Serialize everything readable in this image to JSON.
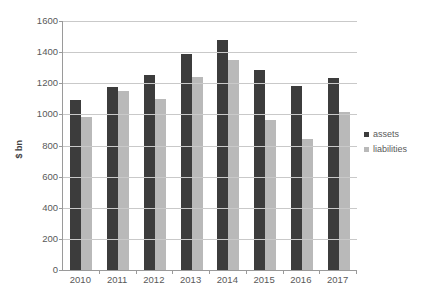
{
  "chart_data": {
    "type": "bar",
    "title": "",
    "subtitle": "",
    "xlabel": "",
    "ylabel": "$ bn",
    "categories": [
      "2010",
      "2011",
      "2012",
      "2013",
      "2014",
      "2015",
      "2016",
      "2017"
    ],
    "series": [
      {
        "name": "assets",
        "color": "#3c3c3c",
        "values": [
          1090,
          1175,
          1250,
          1388,
          1475,
          1283,
          1180,
          1237
        ]
      },
      {
        "name": "liabilities",
        "color": "#b9b9b9",
        "values": [
          985,
          1152,
          1098,
          1240,
          1348,
          967,
          845,
          1013
        ]
      }
    ],
    "ylim": [
      0,
      1600
    ],
    "ytick_step": 200,
    "yticks": [
      "1600",
      "1400",
      "1200",
      "1000",
      "800",
      "600",
      "400",
      "200",
      "0"
    ],
    "grid": true,
    "grid_axis": "y",
    "legend_position": "right"
  },
  "legend": {
    "entries": [
      {
        "label": "assets",
        "color": "#3c3c3c"
      },
      {
        "label": "liabilities",
        "color": "#b9b9b9"
      }
    ]
  },
  "colors": {
    "assets": "#3c3c3c",
    "liabilities": "#b9b9b9",
    "gridline": "#c9c9c9",
    "axis": "#9a9a9a",
    "text": "#595959",
    "background": "#ffffff"
  }
}
